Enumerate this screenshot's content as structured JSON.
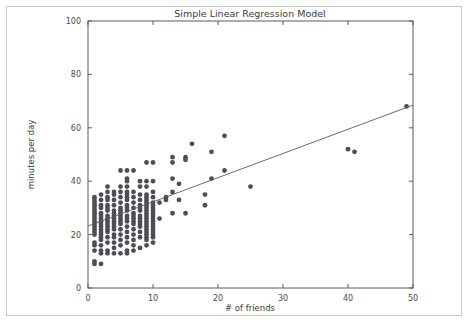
{
  "figure": {
    "background_color": "#ffffff",
    "frame_color": "#c9c9c9",
    "axis_color": "#5a5a5a"
  },
  "chart_data": {
    "type": "scatter",
    "title": "Simple Linear Regression Model",
    "xlabel": "# of friends",
    "ylabel": "minutes per day",
    "xlim": [
      0,
      50
    ],
    "ylim": [
      0,
      100
    ],
    "xticks": [
      0,
      10,
      20,
      30,
      40,
      50
    ],
    "yticks": [
      0,
      20,
      40,
      60,
      80,
      100
    ],
    "xtick_labels": [
      "0",
      "10",
      "20",
      "30",
      "40",
      "50"
    ],
    "ytick_labels": [
      "0",
      "20",
      "40",
      "60",
      "80",
      "100"
    ],
    "grid": false,
    "legend": null,
    "marker_color": "#4d4d55",
    "marker_size": 2.4,
    "series": [
      {
        "name": "observations",
        "type": "scatter",
        "points": [
          [
            1,
            9
          ],
          [
            1,
            10
          ],
          [
            1,
            14
          ],
          [
            1,
            16
          ],
          [
            1,
            17
          ],
          [
            1,
            20
          ],
          [
            1,
            21
          ],
          [
            1,
            23
          ],
          [
            1,
            24
          ],
          [
            1,
            25
          ],
          [
            1,
            27
          ],
          [
            1,
            28
          ],
          [
            1,
            30
          ],
          [
            1,
            31
          ],
          [
            1,
            32
          ],
          [
            1,
            33
          ],
          [
            1,
            34
          ],
          [
            1,
            22
          ],
          [
            1,
            26
          ],
          [
            1,
            29
          ],
          [
            2,
            9
          ],
          [
            2,
            13
          ],
          [
            2,
            14
          ],
          [
            2,
            16
          ],
          [
            2,
            18
          ],
          [
            2,
            19
          ],
          [
            2,
            21
          ],
          [
            2,
            22
          ],
          [
            2,
            24
          ],
          [
            2,
            25
          ],
          [
            2,
            26
          ],
          [
            2,
            28
          ],
          [
            2,
            30
          ],
          [
            2,
            31
          ],
          [
            2,
            33
          ],
          [
            2,
            35
          ],
          [
            2,
            27
          ],
          [
            2,
            23
          ],
          [
            2,
            20
          ],
          [
            3,
            13
          ],
          [
            3,
            14
          ],
          [
            3,
            17
          ],
          [
            3,
            19
          ],
          [
            3,
            21
          ],
          [
            3,
            23
          ],
          [
            3,
            24
          ],
          [
            3,
            26
          ],
          [
            3,
            27
          ],
          [
            3,
            29
          ],
          [
            3,
            31
          ],
          [
            3,
            33
          ],
          [
            3,
            34
          ],
          [
            3,
            36
          ],
          [
            3,
            38
          ],
          [
            3,
            25
          ],
          [
            3,
            22
          ],
          [
            3,
            30
          ],
          [
            4,
            13
          ],
          [
            4,
            15
          ],
          [
            4,
            17
          ],
          [
            4,
            19
          ],
          [
            4,
            20
          ],
          [
            4,
            22
          ],
          [
            4,
            24
          ],
          [
            4,
            25
          ],
          [
            4,
            27
          ],
          [
            4,
            29
          ],
          [
            4,
            31
          ],
          [
            4,
            33
          ],
          [
            4,
            35
          ],
          [
            4,
            36
          ],
          [
            4,
            28
          ],
          [
            4,
            23
          ],
          [
            4,
            26
          ],
          [
            5,
            13
          ],
          [
            5,
            16
          ],
          [
            5,
            18
          ],
          [
            5,
            20
          ],
          [
            5,
            22
          ],
          [
            5,
            24
          ],
          [
            5,
            26
          ],
          [
            5,
            28
          ],
          [
            5,
            30
          ],
          [
            5,
            32
          ],
          [
            5,
            34
          ],
          [
            5,
            36
          ],
          [
            5,
            38
          ],
          [
            5,
            44
          ],
          [
            5,
            25
          ],
          [
            5,
            27
          ],
          [
            5,
            29
          ],
          [
            6,
            13
          ],
          [
            6,
            14
          ],
          [
            6,
            17
          ],
          [
            6,
            19
          ],
          [
            6,
            21
          ],
          [
            6,
            23
          ],
          [
            6,
            25
          ],
          [
            6,
            27
          ],
          [
            6,
            29
          ],
          [
            6,
            31
          ],
          [
            6,
            33
          ],
          [
            6,
            35
          ],
          [
            6,
            36
          ],
          [
            6,
            38
          ],
          [
            6,
            40
          ],
          [
            6,
            41
          ],
          [
            6,
            44
          ],
          [
            6,
            26
          ],
          [
            6,
            30
          ],
          [
            6,
            34
          ],
          [
            7,
            14
          ],
          [
            7,
            16
          ],
          [
            7,
            18
          ],
          [
            7,
            20
          ],
          [
            7,
            22
          ],
          [
            7,
            24
          ],
          [
            7,
            26
          ],
          [
            7,
            28
          ],
          [
            7,
            30
          ],
          [
            7,
            32
          ],
          [
            7,
            34
          ],
          [
            7,
            36
          ],
          [
            7,
            44
          ],
          [
            7,
            25
          ],
          [
            7,
            27
          ],
          [
            8,
            15
          ],
          [
            8,
            19
          ],
          [
            8,
            21
          ],
          [
            8,
            23
          ],
          [
            8,
            25
          ],
          [
            8,
            27
          ],
          [
            8,
            29
          ],
          [
            8,
            31
          ],
          [
            8,
            33
          ],
          [
            8,
            35
          ],
          [
            8,
            38
          ],
          [
            8,
            40
          ],
          [
            8,
            26
          ],
          [
            8,
            30
          ],
          [
            8,
            24
          ],
          [
            9,
            16
          ],
          [
            9,
            18
          ],
          [
            9,
            20
          ],
          [
            9,
            21
          ],
          [
            9,
            22
          ],
          [
            9,
            23
          ],
          [
            9,
            24
          ],
          [
            9,
            25
          ],
          [
            9,
            26
          ],
          [
            9,
            27
          ],
          [
            9,
            28
          ],
          [
            9,
            29
          ],
          [
            9,
            30
          ],
          [
            9,
            31
          ],
          [
            9,
            32
          ],
          [
            9,
            33
          ],
          [
            9,
            35
          ],
          [
            9,
            38
          ],
          [
            9,
            40
          ],
          [
            9,
            47
          ],
          [
            9,
            19
          ],
          [
            9,
            34
          ],
          [
            10,
            17
          ],
          [
            10,
            19
          ],
          [
            10,
            20
          ],
          [
            10,
            21
          ],
          [
            10,
            22
          ],
          [
            10,
            23
          ],
          [
            10,
            24
          ],
          [
            10,
            25
          ],
          [
            10,
            26
          ],
          [
            10,
            27
          ],
          [
            10,
            28
          ],
          [
            10,
            29
          ],
          [
            10,
            30
          ],
          [
            10,
            31
          ],
          [
            10,
            32
          ],
          [
            10,
            34
          ],
          [
            10,
            36
          ],
          [
            10,
            40
          ],
          [
            10,
            47
          ],
          [
            11,
            26
          ],
          [
            11,
            32
          ],
          [
            12,
            33
          ],
          [
            12,
            34
          ],
          [
            13,
            28
          ],
          [
            13,
            36
          ],
          [
            13,
            41
          ],
          [
            13,
            47
          ],
          [
            13,
            49
          ],
          [
            14,
            33
          ],
          [
            14,
            39
          ],
          [
            15,
            28
          ],
          [
            15,
            48
          ],
          [
            15,
            49
          ],
          [
            16,
            54
          ],
          [
            18,
            31
          ],
          [
            18,
            35
          ],
          [
            19,
            41
          ],
          [
            19,
            51
          ],
          [
            21,
            44
          ],
          [
            21,
            57
          ],
          [
            25,
            38
          ],
          [
            40,
            52
          ],
          [
            41,
            51
          ],
          [
            49,
            68
          ]
        ]
      },
      {
        "name": "regression-line",
        "type": "line",
        "color": "#5b5b5b",
        "x_start": 0,
        "y_start": 23.2,
        "x_end": 50,
        "y_end": 68.5,
        "slope": 0.906,
        "intercept": 23.2
      }
    ]
  }
}
